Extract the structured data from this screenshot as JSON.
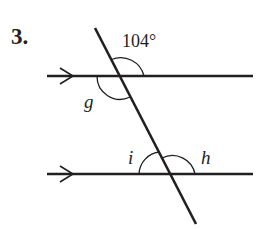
{
  "problem": {
    "number": "3.",
    "given_angle": "104°",
    "angle_labels": {
      "g": "g",
      "h": "h",
      "i": "i"
    },
    "colors": {
      "ink": "#231f20",
      "background": "#ffffff"
    }
  },
  "diagram": {
    "parallel_lines": 2,
    "transversals": 1,
    "parallel_marks": "single arrow on each line"
  }
}
